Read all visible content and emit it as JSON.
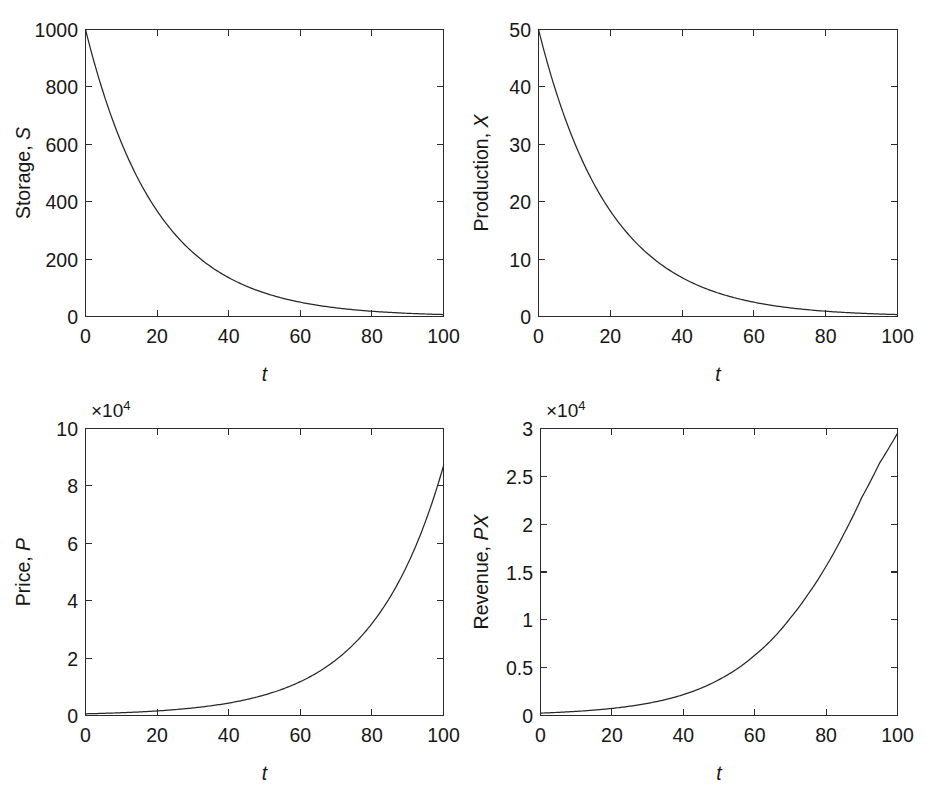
{
  "figure": {
    "background_color": "#ffffff",
    "line_color": "#272727",
    "text_color": "#171717",
    "panel_count": 4,
    "layout": "2x2"
  },
  "panels": [
    {
      "id": "storage",
      "ylabel_plain": "Storage, ",
      "ylabel_italic": "S",
      "xlabel": "t",
      "offset_label": "",
      "offset_exponent": ""
    },
    {
      "id": "production",
      "ylabel_plain": "Production, ",
      "ylabel_italic": "X",
      "xlabel": "t",
      "offset_label": "",
      "offset_exponent": ""
    },
    {
      "id": "price",
      "ylabel_plain": "Price, ",
      "ylabel_italic": "P",
      "xlabel": "t",
      "offset_label": "×10",
      "offset_exponent": "4"
    },
    {
      "id": "revenue",
      "ylabel_plain": "Revenue, ",
      "ylabel_italic": "PX",
      "xlabel": "t",
      "offset_label": "×10",
      "offset_exponent": "4"
    }
  ],
  "chart_data": [
    {
      "type": "line",
      "id": "storage",
      "title": "",
      "xlabel": "t",
      "ylabel": "Storage, S",
      "xlim": [
        0,
        100
      ],
      "ylim": [
        0,
        1000
      ],
      "xticks": [
        0,
        20,
        40,
        60,
        80,
        100
      ],
      "xticklabels": [
        "0",
        "20",
        "40",
        "60",
        "80",
        "100"
      ],
      "yticks": [
        0,
        200,
        400,
        600,
        800,
        1000
      ],
      "yticklabels": [
        "0",
        "200",
        "400",
        "600",
        "800",
        "1000"
      ],
      "grid": false,
      "legend": false,
      "offset_factor": 1,
      "series": [
        {
          "name": "Storage",
          "formula": "S(t) = 1000 * exp(-0.05 t)",
          "x": [
            0,
            5,
            10,
            15,
            20,
            25,
            30,
            35,
            40,
            45,
            50,
            55,
            60,
            65,
            70,
            75,
            80,
            85,
            90,
            95,
            100
          ],
          "values": [
            1000,
            778.8,
            606.5,
            472.4,
            367.9,
            286.5,
            223.1,
            173.8,
            135.3,
            105.4,
            82.1,
            63.9,
            49.8,
            38.8,
            30.2,
            23.5,
            18.3,
            14.3,
            11.1,
            8.7,
            6.7
          ]
        }
      ]
    },
    {
      "type": "line",
      "id": "production",
      "title": "",
      "xlabel": "t",
      "ylabel": "Production, X",
      "xlim": [
        0,
        100
      ],
      "ylim": [
        0,
        50
      ],
      "xticks": [
        0,
        20,
        40,
        60,
        80,
        100
      ],
      "xticklabels": [
        "0",
        "20",
        "40",
        "60",
        "80",
        "100"
      ],
      "yticks": [
        0,
        10,
        20,
        30,
        40,
        50
      ],
      "yticklabels": [
        "0",
        "10",
        "20",
        "30",
        "40",
        "50"
      ],
      "grid": false,
      "legend": false,
      "offset_factor": 1,
      "series": [
        {
          "name": "Production",
          "formula": "X(t) = 50 * exp(-0.05 t)",
          "x": [
            0,
            5,
            10,
            15,
            20,
            25,
            30,
            35,
            40,
            45,
            50,
            55,
            60,
            65,
            70,
            75,
            80,
            85,
            90,
            95,
            100
          ],
          "values": [
            50,
            38.94,
            30.33,
            23.62,
            18.39,
            14.33,
            11.16,
            8.69,
            6.77,
            5.27,
            4.1,
            3.2,
            2.49,
            1.94,
            1.51,
            1.18,
            0.92,
            0.71,
            0.56,
            0.43,
            0.34
          ]
        }
      ]
    },
    {
      "type": "line",
      "id": "price",
      "title": "",
      "xlabel": "t",
      "ylabel": "Price, P",
      "xlim": [
        0,
        100
      ],
      "ylim": [
        0,
        100000
      ],
      "xticks": [
        0,
        20,
        40,
        60,
        80,
        100
      ],
      "xticklabels": [
        "0",
        "20",
        "40",
        "60",
        "80",
        "100"
      ],
      "yticks": [
        0,
        20000,
        40000,
        60000,
        80000,
        100000
      ],
      "yticklabels": [
        "0",
        "2",
        "4",
        "6",
        "8",
        "10"
      ],
      "y_offset_text": "×10⁴",
      "grid": false,
      "legend": false,
      "offset_factor": 10000,
      "series": [
        {
          "name": "Price",
          "formula": "P(t) = 587 * exp(0.05 t)",
          "x": [
            0,
            10,
            20,
            30,
            40,
            50,
            55,
            60,
            65,
            70,
            75,
            80,
            85,
            90,
            95,
            98,
            100
          ],
          "values": [
            587,
            968,
            1596,
            2631,
            4338,
            7152,
            9181,
            11786,
            15131,
            19425,
            24937,
            32011,
            41094,
            52754,
            67720,
            78680,
            87000
          ]
        }
      ]
    },
    {
      "type": "line",
      "id": "revenue",
      "title": "",
      "xlabel": "t",
      "ylabel": "Revenue, PX",
      "xlim": [
        0,
        100
      ],
      "ylim": [
        0,
        30000
      ],
      "xticks": [
        0,
        20,
        40,
        60,
        80,
        100
      ],
      "xticklabels": [
        "0",
        "20",
        "40",
        "60",
        "80",
        "100"
      ],
      "yticks": [
        0,
        5000,
        10000,
        15000,
        20000,
        25000,
        30000
      ],
      "yticklabels": [
        "0",
        "0.5",
        "1",
        "1.5",
        "2",
        "2.5",
        "3"
      ],
      "y_offset_text": "×10⁴",
      "grid": false,
      "legend": false,
      "offset_factor": 10000,
      "series": [
        {
          "name": "Revenue",
          "formula": "PX(t) ≈ growing convex curve reaching 2.95e4 at t=100",
          "x": [
            0,
            10,
            20,
            30,
            40,
            50,
            60,
            70,
            75,
            80,
            85,
            90,
            95,
            100
          ],
          "values": [
            250,
            430,
            740,
            1270,
            2180,
            3750,
            6300,
            10200,
            12700,
            15600,
            19000,
            22800,
            26400,
            29500
          ]
        }
      ]
    }
  ]
}
